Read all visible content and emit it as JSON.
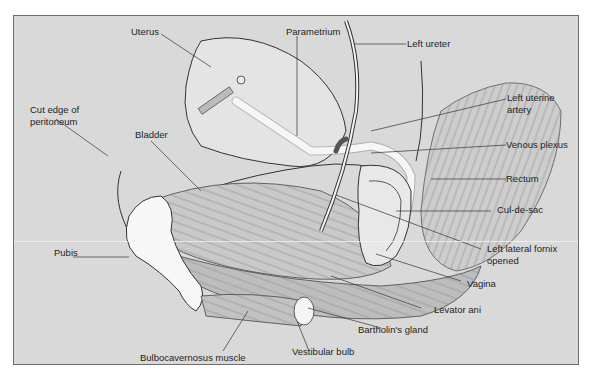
{
  "diagram": {
    "type": "anatomical-illustration",
    "colors": {
      "background": "#d9d9d9",
      "frame_border": "#6e6e6e",
      "bone": "#f7f7f7",
      "muscle": "#c4c4c4",
      "line": "#333333"
    },
    "labels": {
      "uterus": "Uterus",
      "parametrium": "Parametrium",
      "left_ureter": "Left ureter",
      "cut_edge_1": "Cut edge of",
      "cut_edge_2": "peritoneum",
      "bladder": "Bladder",
      "left_uterine_artery_1": "Left uterine",
      "left_uterine_artery_2": "artery",
      "venous_plexus": "Venous plexus",
      "rectum": "Rectum",
      "cul_de_sac": "Cul-de-sac",
      "pubis": "Pubis",
      "left_lateral_fornix_1": "Left lateral fornix",
      "left_lateral_fornix_2": "opened",
      "vagina": "Vagina",
      "levator_ani": "Levator ani",
      "bartholins_gland": "Bartholin's gland",
      "bulbocavernosus": "Bulbocavernosus muscle",
      "vestibular_bulb": "Vestibular bulb"
    }
  }
}
